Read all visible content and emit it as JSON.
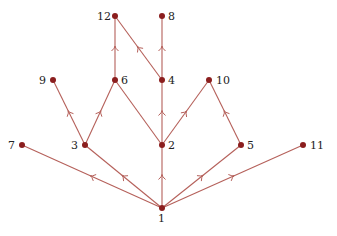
{
  "diagram": {
    "type": "directed-graph",
    "edge_color": "#b5605a",
    "node_color": "#8b1e1e",
    "nodes": [
      {
        "id": "1",
        "x": 162,
        "y": 208,
        "label_dx": -4,
        "label_dy": 5
      },
      {
        "id": "2",
        "x": 162,
        "y": 145,
        "label_dx": 6,
        "label_dy": -5
      },
      {
        "id": "3",
        "x": 85,
        "y": 145,
        "label_dx": -14,
        "label_dy": -5
      },
      {
        "id": "4",
        "x": 162,
        "y": 80,
        "label_dx": 6,
        "label_dy": -5
      },
      {
        "id": "5",
        "x": 241,
        "y": 145,
        "label_dx": 6,
        "label_dy": -5
      },
      {
        "id": "6",
        "x": 115,
        "y": 80,
        "label_dx": 6,
        "label_dy": -5
      },
      {
        "id": "7",
        "x": 22,
        "y": 145,
        "label_dx": -14,
        "label_dy": -5
      },
      {
        "id": "8",
        "x": 162,
        "y": 16,
        "label_dx": 6,
        "label_dy": -5
      },
      {
        "id": "9",
        "x": 53,
        "y": 80,
        "label_dx": -14,
        "label_dy": -5
      },
      {
        "id": "10",
        "x": 209,
        "y": 80,
        "label_dx": 7,
        "label_dy": -5
      },
      {
        "id": "11",
        "x": 303,
        "y": 145,
        "label_dx": 7,
        "label_dy": -5
      },
      {
        "id": "12",
        "x": 115,
        "y": 16,
        "label_dx": -18,
        "label_dy": -5
      }
    ],
    "edges": [
      {
        "from": "1",
        "to": "7",
        "arrow": true
      },
      {
        "from": "1",
        "to": "3",
        "arrow": true
      },
      {
        "from": "1",
        "to": "2",
        "arrow": true
      },
      {
        "from": "1",
        "to": "5",
        "arrow": true
      },
      {
        "from": "1",
        "to": "11",
        "arrow": true
      },
      {
        "from": "3",
        "to": "9",
        "arrow": true
      },
      {
        "from": "3",
        "to": "6",
        "arrow": true
      },
      {
        "from": "2",
        "to": "6",
        "arrow": false
      },
      {
        "from": "2",
        "to": "4",
        "arrow": true
      },
      {
        "from": "2",
        "to": "10",
        "arrow": true
      },
      {
        "from": "5",
        "to": "10",
        "arrow": true
      },
      {
        "from": "6",
        "to": "12",
        "arrow": true
      },
      {
        "from": "4",
        "to": "12",
        "arrow": true
      },
      {
        "from": "4",
        "to": "8",
        "arrow": true
      }
    ]
  }
}
